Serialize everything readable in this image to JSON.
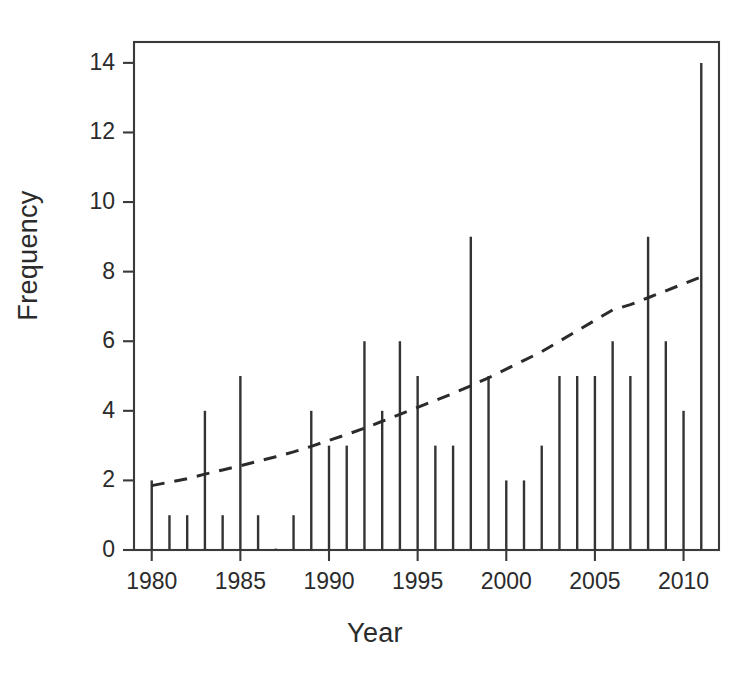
{
  "chart_data": {
    "type": "bar",
    "title": "",
    "xlabel": "Year",
    "ylabel": "Frequency",
    "xlim": [
      1979.0,
      2012.0
    ],
    "ylim": [
      0,
      14.6
    ],
    "grid": false,
    "legend": "none",
    "x_ticks": [
      1980,
      1985,
      1990,
      1995,
      2000,
      2005,
      2010
    ],
    "y_ticks": [
      0,
      2,
      4,
      6,
      8,
      10,
      12,
      14
    ],
    "categories": [
      1980,
      1981,
      1982,
      1983,
      1984,
      1985,
      1986,
      1987,
      1988,
      1989,
      1990,
      1991,
      1992,
      1993,
      1994,
      1995,
      1996,
      1997,
      1998,
      1999,
      2000,
      2001,
      2002,
      2003,
      2004,
      2005,
      2006,
      2007,
      2008,
      2009,
      2010,
      2011
    ],
    "values": [
      2,
      1,
      1,
      4,
      1,
      5,
      1,
      0,
      1,
      4,
      3,
      3,
      6,
      4,
      6,
      5,
      3,
      3,
      9,
      5,
      2,
      2,
      3,
      5,
      5,
      5,
      6,
      5,
      9,
      6,
      4,
      14
    ],
    "series": [
      {
        "name": "Frequency",
        "style": "vertical-lines",
        "color": "#333333",
        "values": [
          2,
          1,
          1,
          4,
          1,
          5,
          1,
          0,
          1,
          4,
          3,
          3,
          6,
          4,
          6,
          5,
          3,
          3,
          9,
          5,
          2,
          2,
          3,
          5,
          5,
          5,
          6,
          5,
          9,
          6,
          4,
          14
        ]
      },
      {
        "name": "trend",
        "style": "dashed-line",
        "color": "#2b2b2b",
        "x": [
          1980,
          1981,
          1982,
          1983,
          1984,
          1985,
          1986,
          1987,
          1988,
          1989,
          1990,
          1991,
          1992,
          1993,
          1994,
          1995,
          1996,
          1997,
          1998,
          1999,
          2000,
          2001,
          2002,
          2003,
          2004,
          2005,
          2006,
          2007,
          2008,
          2009,
          2010,
          2011
        ],
        "values": [
          1.85,
          1.95,
          2.05,
          2.18,
          2.3,
          2.42,
          2.55,
          2.68,
          2.82,
          2.98,
          3.15,
          3.32,
          3.5,
          3.7,
          3.9,
          4.1,
          4.3,
          4.5,
          4.72,
          4.95,
          5.2,
          5.45,
          5.7,
          6.0,
          6.3,
          6.6,
          6.9,
          7.05,
          7.25,
          7.45,
          7.65,
          7.85
        ]
      }
    ]
  },
  "axes": {
    "y_label": "Frequency",
    "x_label": "Year",
    "y_tick_labels": [
      "0",
      "2",
      "4",
      "6",
      "8",
      "10",
      "12",
      "14"
    ],
    "x_tick_labels": [
      "1980",
      "1985",
      "1990",
      "1995",
      "2000",
      "2005",
      "2010"
    ]
  },
  "colors": {
    "background": "#ffffff",
    "axis": "#3a3a3a",
    "bar": "#333333",
    "trend": "#2b2b2b",
    "text": "#2b2b2b"
  }
}
